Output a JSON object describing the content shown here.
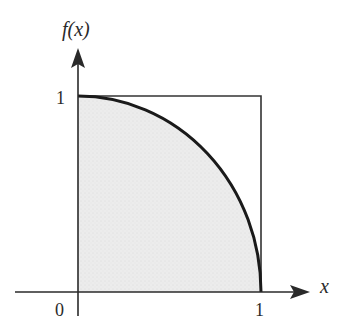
{
  "diagram": {
    "type": "function-plot",
    "y_axis_label": "f(x)",
    "x_axis_label": "x",
    "origin_label": "0",
    "y_tick_label": "1",
    "x_tick_label": "1",
    "colors": {
      "axis": "#2a2a2a",
      "curve": "#1a1a1a",
      "square": "#333333",
      "fill": "#ececec",
      "background": "#ffffff"
    }
  }
}
